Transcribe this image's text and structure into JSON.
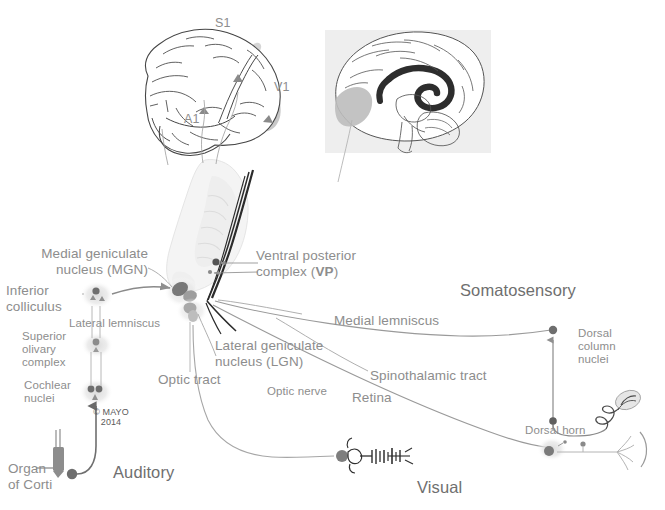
{
  "figure": {
    "title_semantics": "Ascending sensory pathways to thalamus and cerebral cortex",
    "copyright_line1": "© MAYO",
    "copyright_line2": "2014"
  },
  "system_labels": {
    "auditory": "Auditory",
    "visual": "Visual",
    "somatosensory": "Somatosensory"
  },
  "cortex_labels": {
    "s1": "S1",
    "v1": "V1",
    "a1": "A1"
  },
  "auditory_pathway": {
    "mgn": "Medial geniculate\nnucleus (MGN)",
    "inferior_colliculus": "Inferior\ncolliculus",
    "lateral_lemniscus": "Lateral lemniscus",
    "superior_olivary_complex": "Superior\nolivary\ncomplex",
    "cochlear_nuclei": "Cochlear\nnuclei",
    "organ_of_corti": "Organ\nof Corti"
  },
  "visual_pathway": {
    "lgn": "Lateral geniculate\nnucleus (LGN)",
    "optic_tract": "Optic tract",
    "optic_nerve": "Optic nerve",
    "retina": "Retina"
  },
  "somatosensory_pathway": {
    "vp_prefix": "Ventral posterior\ncomplex (",
    "vp_bold": "VP",
    "vp_suffix": ")",
    "vp_full": "Ventral posterior complex (VP)",
    "medial_lemniscus": "Medial lemniscus",
    "spinothalamic_tract": "Spinothalamic tract",
    "dorsal_column_nuclei": "Dorsal\ncolumn\nnuclei",
    "dorsal_horn": "Dorsal horn"
  },
  "colors": {
    "text_light": "#8d8d8d",
    "text_dark": "#6f6f6f",
    "outline": "#4a4a4a",
    "leader_line": "#9a9a9a",
    "nucleus_dark": "#6b6b6b",
    "nucleus_mid": "#9b9b9b",
    "nucleus_halo": "#e2e2e2",
    "inset_bg": "#eeeeee",
    "cortex_shade": "#c9c9c9",
    "tract_dark": "#2e2e2e",
    "thalamus_fill": "#f2f2f2"
  }
}
